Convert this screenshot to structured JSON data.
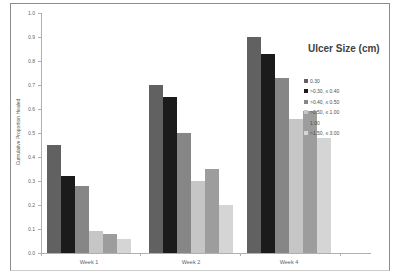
{
  "chart_data": {
    "type": "bar",
    "title": "",
    "legend_title": "Ulcer Size (cm)",
    "legend_position": "right",
    "xlabel": "",
    "ylabel": "Cumulative Proportion Healed",
    "ylim": [
      0,
      1.0
    ],
    "ytick_step": 0.1,
    "yticks": [
      "1.0",
      "0.9",
      "0.8",
      "0.7",
      "0.6",
      "0.5",
      "0.4",
      "0.3",
      "0.2",
      "0.1",
      "0.0"
    ],
    "grid": false,
    "categories": [
      "Week 1",
      "Week 2",
      "Week 4"
    ],
    "series": [
      {
        "name": "0.30",
        "color": "#616161",
        "values": [
          0.45,
          0.7,
          0.9
        ]
      },
      {
        "name": ">0.30, ≤ 0.40",
        "color": "#1b1b1b",
        "values": [
          0.32,
          0.65,
          0.83
        ]
      },
      {
        "name": ">0.40, ≤ 0.50",
        "color": "#868686",
        "values": [
          0.28,
          0.5,
          0.73
        ]
      },
      {
        "name": ">0.50, ≤ 1.00",
        "color": "#c6c6c6",
        "values": [
          0.09,
          0.3,
          0.56
        ]
      },
      {
        "name": "1.00",
        "color": "#9d9d9d",
        "values": [
          0.08,
          0.35,
          0.59
        ]
      },
      {
        "name": ">1.50, ≤ 3.00",
        "color": "#d5d5d5",
        "values": [
          0.06,
          0.2,
          0.48
        ]
      }
    ]
  }
}
